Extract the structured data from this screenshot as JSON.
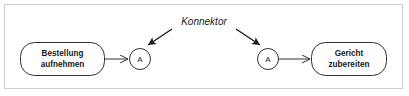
{
  "diagram": {
    "frame_border_color": "#cfcfcf",
    "background_color": "#ffffff",
    "stroke_color": "#333333",
    "text_color": "#1a1a1a",
    "nodes": [
      {
        "id": "start",
        "type": "rounded-rectangle",
        "line1": "Bestellung",
        "line2": "aufnehmen"
      },
      {
        "id": "end",
        "type": "rounded-rectangle",
        "line1": "Gericht",
        "line2": "zubereiten"
      }
    ],
    "connectors": [
      {
        "id": "connector-left",
        "type": "circle",
        "label": "A"
      },
      {
        "id": "connector-right",
        "type": "circle",
        "label": "A"
      }
    ],
    "annotation": {
      "label": "Konnektor",
      "style": "italic",
      "points_to": [
        "connector-left",
        "connector-right"
      ]
    },
    "edges": [
      {
        "from": "start",
        "to": "connector-left",
        "arrowhead": "open"
      },
      {
        "from": "connector-right",
        "to": "end",
        "arrowhead": "open"
      }
    ]
  }
}
